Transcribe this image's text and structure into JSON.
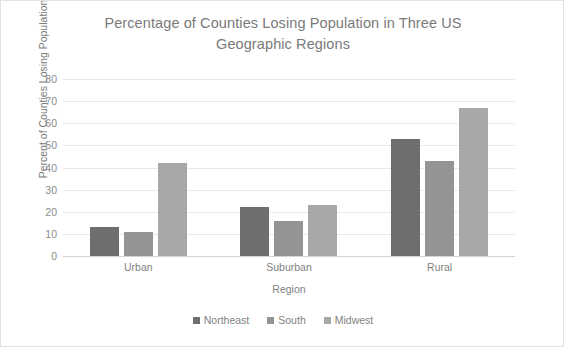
{
  "chart_data": {
    "type": "bar",
    "title": "Percentage of Counties Losing Population in Three US Geographic Regions",
    "title_line1": "Percentage of Counties Losing Population in Three US",
    "title_line2": "Geographic Regions",
    "xlabel": "Region",
    "ylabel": "Percent of Counties  Losing Population",
    "categories": [
      "Urban",
      "Suburban",
      "Rural"
    ],
    "series": [
      {
        "name": "Northeast",
        "color": "#6e6e6e",
        "values": [
          13,
          22,
          53
        ]
      },
      {
        "name": "South",
        "color": "#949494",
        "values": [
          11,
          16,
          43
        ]
      },
      {
        "name": "Midwest",
        "color": "#a8a8a8",
        "values": [
          42,
          23,
          67
        ]
      }
    ],
    "ylim": [
      0,
      80
    ],
    "yticks": [
      0,
      10,
      20,
      30,
      40,
      50,
      60,
      70,
      80
    ],
    "ytick_labels": [
      "0",
      "10",
      "20",
      "30",
      "40",
      "50",
      "60",
      "70",
      "80"
    ],
    "grid": true,
    "legend_position": "bottom"
  }
}
